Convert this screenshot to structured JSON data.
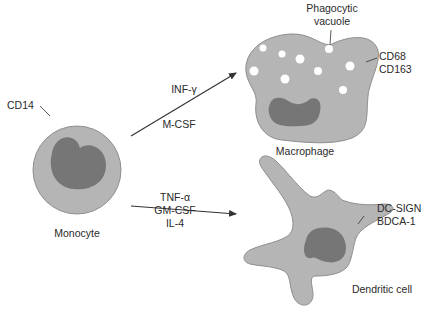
{
  "diagram": {
    "colors": {
      "cytoplasm": "#b5b5b5",
      "cytoplasm_edge": "#8e8e8e",
      "nucleus": "#767676",
      "vacuole": "#ffffff",
      "line": "#333333",
      "text": "#2a2a2a"
    },
    "monocyte": {
      "name": "Monocyte",
      "marker": "CD14"
    },
    "macrophage": {
      "name": "Macrophage",
      "markers": [
        "CD68",
        "CD163"
      ],
      "vacuole_label": [
        "Phagocytic",
        "vacuole"
      ]
    },
    "dendritic_cell": {
      "name": "Dendritic cell",
      "markers": [
        "DC-SIGN",
        "BDCA-1"
      ]
    },
    "arrows": {
      "to_macrophage": {
        "factors": [
          "INF-γ",
          "M-CSF"
        ]
      },
      "to_dendritic": {
        "factors": [
          "TNF-α",
          "GM-CSF",
          "IL-4"
        ]
      }
    }
  }
}
